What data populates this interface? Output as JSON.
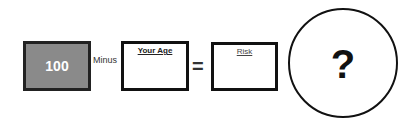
{
  "equation": {
    "base_value": "100",
    "operator_minus": "Minus",
    "age_label": "Your Age",
    "operator_equals": "=",
    "risk_label": "Risk",
    "result_symbol": "?"
  },
  "colors": {
    "base_box_fill": "#8a8a8a",
    "border": "#111111",
    "base_text": "#ffffff"
  }
}
